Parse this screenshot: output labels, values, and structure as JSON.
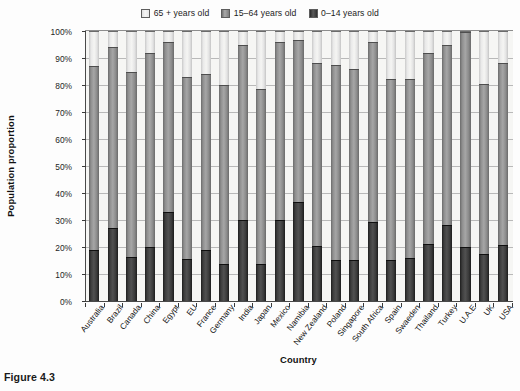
{
  "caption": "Figure 4.3",
  "legend": {
    "position": "top-center",
    "entries": [
      {
        "label": "65 + years old",
        "swatch": "light-gray-swatch",
        "color": "#efefef"
      },
      {
        "label": "15–64 years old",
        "swatch": "medium-gray-swatch",
        "color": "#a0a0a0"
      },
      {
        "label": "0–14 years old",
        "swatch": "dark-gray-swatch",
        "color": "#3a3a3a"
      }
    ]
  },
  "chart_data": {
    "type": "bar",
    "subtype": "stacked-bar-100-percent",
    "title": "",
    "xlabel": "Country",
    "ylabel": "Population proportion",
    "ylim": [
      0,
      100
    ],
    "ytick_labels": [
      "0%",
      "10%",
      "20%",
      "30%",
      "40%",
      "50%",
      "60%",
      "70%",
      "80%",
      "90%",
      "100%"
    ],
    "ytick_values": [
      0,
      10,
      20,
      30,
      40,
      50,
      60,
      70,
      80,
      90,
      100
    ],
    "grid": true,
    "legend_position": "top-center",
    "categories": [
      "Australia",
      "Brazil",
      "Canada",
      "China",
      "Egypt",
      "EU",
      "France",
      "Germany",
      "India",
      "Japan",
      "Mexico",
      "Namibia",
      "New Zealand",
      "Poland",
      "Singapore",
      "South Africa",
      "Spain",
      "Swaeden",
      "Thailand",
      "Turkey",
      "U.A.E",
      "UK",
      "USA"
    ],
    "series": [
      {
        "name": "0–14 years old",
        "color": "#3a3a3a",
        "values": [
          19,
          27,
          16.3,
          20,
          33,
          15.5,
          19,
          13.7,
          30,
          13.7,
          30,
          36.5,
          20.5,
          15.3,
          15.1,
          29.3,
          15.1,
          16,
          21,
          28,
          20.2,
          17.3,
          20.6
        ]
      },
      {
        "name": "15–64 years old",
        "color": "#a0a0a0",
        "values": [
          68,
          67,
          68.7,
          72,
          63,
          67.5,
          65,
          66.3,
          65,
          64.8,
          66,
          60,
          67.5,
          72,
          70.9,
          66.7,
          67.2,
          66.2,
          70.7,
          67,
          79.6,
          62.9,
          67.5
        ]
      },
      {
        "name": "65 + years old",
        "color": "#efefef",
        "values": [
          13,
          6,
          15,
          8,
          4,
          17,
          16,
          20,
          5,
          21.5,
          4,
          3.5,
          12,
          12.7,
          14,
          4,
          17.7,
          17.8,
          8.3,
          5,
          0.2,
          19.8,
          11.9
        ]
      }
    ],
    "cumulative_tops_0_14": [
      19,
      27,
      16.3,
      20,
      33,
      15.5,
      19,
      13.7,
      30,
      13.7,
      30,
      36.5,
      20.5,
      15.3,
      15.1,
      29.3,
      15.1,
      16,
      21,
      28,
      20.2,
      17.3,
      20.6
    ],
    "cumulative_tops_15_64": [
      87,
      94,
      85,
      92,
      96,
      83,
      84,
      80,
      95,
      78.5,
      96,
      96.5,
      88,
      87.3,
      86,
      96,
      82.3,
      82.2,
      91.7,
      95,
      99.8,
      80.2,
      88.1
    ]
  }
}
